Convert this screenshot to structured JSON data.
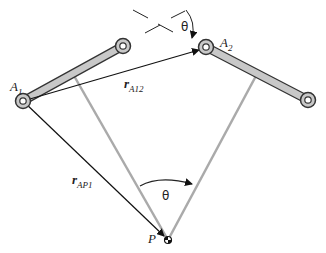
{
  "diagram": {
    "type": "planar-linkage-kinematics",
    "points": {
      "A1": {
        "label": "A",
        "sub": "1",
        "x": 23,
        "y": 101
      },
      "A2": {
        "label": "A",
        "sub": "2",
        "x": 206,
        "y": 47
      },
      "P": {
        "label": "P",
        "x": 168,
        "y": 240
      },
      "link1_end": {
        "x": 123,
        "y": 46
      },
      "link2_end": {
        "x": 308,
        "y": 100
      }
    },
    "vectors": [
      {
        "name": "r_A12",
        "label": "r",
        "sub": "A12",
        "from": "A1",
        "to": "A2"
      },
      {
        "name": "r_AP1",
        "label": "r",
        "sub": "AP1",
        "from": "A1",
        "to": "P"
      }
    ],
    "angles": [
      {
        "label": "θ",
        "location": "at P between gray lines"
      },
      {
        "label": "θ",
        "location": "at A2 between dashed reference lines"
      }
    ],
    "colors": {
      "link_fill": "#c8c8c8",
      "link_stroke": "#333333",
      "gray_line": "#aaaaaa",
      "vector": "#111111"
    }
  }
}
